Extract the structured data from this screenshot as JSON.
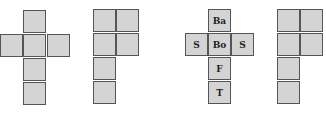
{
  "colors": {
    "fill": "#d4d4d4",
    "border": "#555555",
    "label": "#222222"
  },
  "nets": [
    {
      "name": "net-1-cross",
      "cells": [
        {
          "x": 23,
          "y": 10,
          "label": ""
        },
        {
          "x": 0,
          "y": 34,
          "label": ""
        },
        {
          "x": 23,
          "y": 34,
          "label": ""
        },
        {
          "x": 47,
          "y": 34,
          "label": ""
        },
        {
          "x": 23,
          "y": 58,
          "label": ""
        },
        {
          "x": 23,
          "y": 82,
          "label": ""
        }
      ]
    },
    {
      "name": "net-2-l-shape",
      "cells": [
        {
          "x": 93,
          "y": 9,
          "label": ""
        },
        {
          "x": 116,
          "y": 9,
          "label": ""
        },
        {
          "x": 93,
          "y": 33,
          "label": ""
        },
        {
          "x": 116,
          "y": 33,
          "label": ""
        },
        {
          "x": 93,
          "y": 57,
          "label": ""
        },
        {
          "x": 93,
          "y": 81,
          "label": ""
        }
      ]
    },
    {
      "name": "net-3-labeled-cross",
      "cells": [
        {
          "x": 208,
          "y": 9,
          "label": "Ba"
        },
        {
          "x": 185,
          "y": 33,
          "label": "S"
        },
        {
          "x": 208,
          "y": 33,
          "label": "Bo"
        },
        {
          "x": 231,
          "y": 33,
          "label": "S"
        },
        {
          "x": 208,
          "y": 57,
          "label": "F"
        },
        {
          "x": 208,
          "y": 81,
          "label": "T"
        }
      ]
    },
    {
      "name": "net-4-l-shape",
      "cells": [
        {
          "x": 277,
          "y": 9,
          "label": ""
        },
        {
          "x": 300,
          "y": 9,
          "label": ""
        },
        {
          "x": 277,
          "y": 33,
          "label": ""
        },
        {
          "x": 300,
          "y": 33,
          "label": ""
        },
        {
          "x": 277,
          "y": 57,
          "label": ""
        },
        {
          "x": 277,
          "y": 81,
          "label": ""
        }
      ]
    }
  ]
}
